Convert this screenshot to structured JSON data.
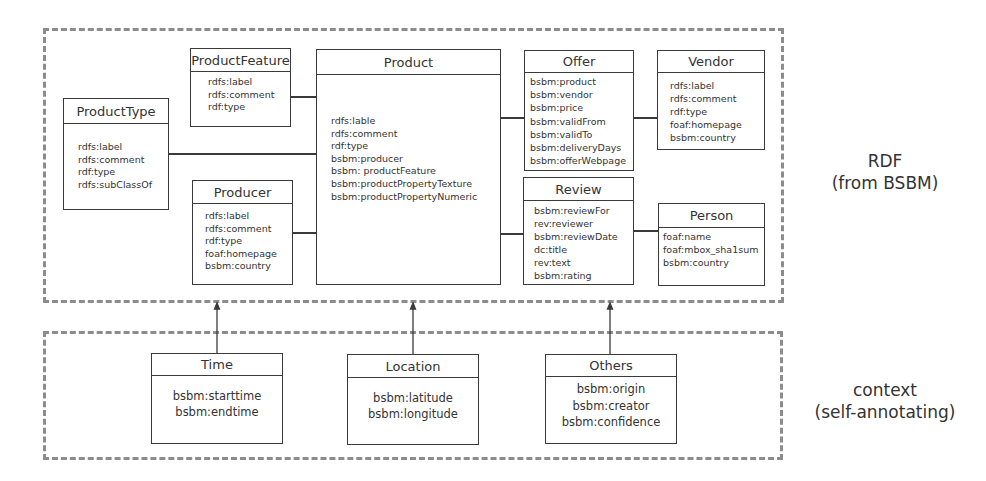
{
  "regions": {
    "rdf": {
      "label_line1": "RDF",
      "label_line2": "(from BSBM)"
    },
    "context": {
      "label_line1": "context",
      "label_line2": "(self-annotating)"
    }
  },
  "classes": {
    "product_feature": {
      "title": "ProductFeature",
      "attributes": [
        "rdfs:label",
        "rdfs:comment",
        "rdf:type"
      ]
    },
    "product_type": {
      "title": "ProductType",
      "attributes": [
        "rdfs:label",
        "rdfs:comment",
        "rdf:type",
        "rdfs:subClassOf"
      ]
    },
    "product": {
      "title": "Product",
      "attributes": [
        "rdfs:lable",
        "rdfs:comment",
        "rdf:type",
        "bsbm:producer",
        "bsbm: productFeature",
        "bsbm:productPropertyTexture",
        "bsbm:productPropertyNumeric"
      ]
    },
    "producer": {
      "title": "Producer",
      "attributes": [
        "rdfs:label",
        "rdfs:comment",
        "rdf:type",
        "foaf:homepage",
        "bsbm:country"
      ]
    },
    "offer": {
      "title": "Offer",
      "attributes": [
        "bsbm:product",
        "bsbm:vendor",
        "bsbm:price",
        "bsbm:validFrom",
        "bsbm:validTo",
        "bsbm:deliveryDays",
        "bsbm:offerWebpage"
      ]
    },
    "vendor": {
      "title": "Vendor",
      "attributes": [
        "rdfs:label",
        "rdfs:comment",
        "rdf:type",
        "foaf:homepage",
        "bsbm:country"
      ]
    },
    "review": {
      "title": "Review",
      "attributes": [
        "bsbm:reviewFor",
        "rev:reviewer",
        "bsbm:reviewDate",
        "dc:title",
        "rev:text",
        "bsbm:rating"
      ]
    },
    "person": {
      "title": "Person",
      "attributes": [
        "foaf:name",
        "foaf:mbox_sha1sum",
        "bsbm:country"
      ]
    },
    "time": {
      "title": "Time",
      "attributes": [
        "bsbm:starttime",
        "bsbm:endtime"
      ]
    },
    "location": {
      "title": "Location",
      "attributes": [
        "bsbm:latitude",
        "bsbm:longitude"
      ]
    },
    "others": {
      "title": "Others",
      "attributes": [
        "bsbm:origin",
        "bsbm:creator",
        "bsbm:confidence"
      ]
    }
  },
  "colors": {
    "dashed_border": "#8c8c8c",
    "box_border": "#3a3a3a",
    "text": "#333333"
  }
}
